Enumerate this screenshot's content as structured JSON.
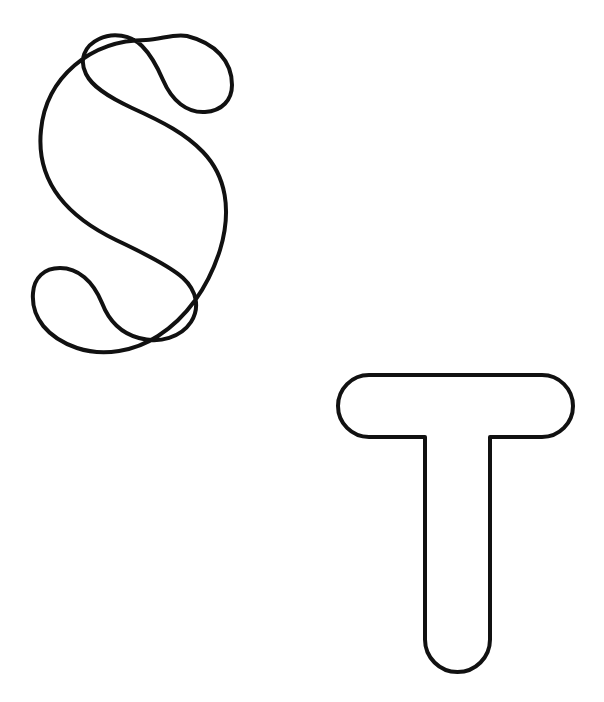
{
  "page": {
    "kind": "coloring-page",
    "width": 604,
    "height": 702,
    "background_color": "#ffffff",
    "stroke_color": "#111111",
    "fill_color": "#ffffff",
    "stroke_width": 4,
    "text_content": "",
    "caption": ""
  },
  "letters": [
    {
      "id": "letter-s",
      "character": "S",
      "name": "letter-s-outline",
      "style": "rounded bubble outline",
      "bounds": {
        "x": 40,
        "y": 40,
        "width": 209,
        "height": 310
      },
      "center": {
        "x": 144,
        "y": 195
      }
    },
    {
      "id": "letter-t",
      "character": "T",
      "name": "letter-t-outline",
      "style": "rounded bubble outline",
      "bounds": {
        "x": 338,
        "y": 375,
        "width": 235,
        "height": 297
      },
      "center": {
        "x": 455,
        "y": 523
      },
      "parts": {
        "crossbar": {
          "x": 338,
          "y": 375,
          "width": 235,
          "height": 62
        },
        "stem": {
          "x": 423,
          "y": 437,
          "width": 69,
          "height": 235
        }
      }
    }
  ],
  "paths": {
    "letter_s": "M 191 172 C 205 166 214 155 214 141 C 214 117 190 99 158 99 C 120 99 92 124 92 154 C 92 176 105 193 133 207 L 190 235 C 228 254 248 281 248 312 C 248 371 192 413 120 413 C 56 413 14 381 14 337 C 14 316 27 302 46 302 C 63 302 76 314 76 330 C 76 345 66 355 51 358",
    "letter_t_crossbar": "M 369 377 H 542 A 29 29 0 0 1 542 435 H 369 A 29 29 0 0 1 369 377 Z",
    "letter_t_stem": "M 425 435 V 637 A 32 32 0 0 0 489 637 V 435"
  }
}
